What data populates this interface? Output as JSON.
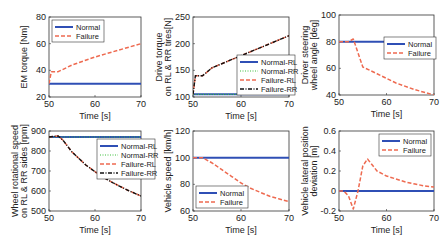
{
  "colors": {
    "normal": "#2f4fb5",
    "failure": "#ee6a50",
    "normal_rr": "#3fbf3f",
    "failure_rr": "#111111"
  },
  "chart_data": [
    {
      "type": "line",
      "ylabel": "EM torque [Nm]",
      "xlabel": "Time [s]",
      "xlim": [
        50,
        70
      ],
      "ylim": [
        20,
        80
      ],
      "xticks": [
        "50",
        "60",
        "70"
      ],
      "yticks": [
        "20",
        "40",
        "60",
        "80"
      ],
      "legend": [
        "Normal",
        "Failure"
      ],
      "legend_position": "upper left",
      "series": [
        {
          "name": "Normal",
          "x": [
            50,
            70
          ],
          "y": [
            30,
            30
          ]
        },
        {
          "name": "Failure",
          "x": [
            50,
            50.5,
            51,
            52,
            55,
            60,
            65,
            70
          ],
          "y": [
            30,
            39,
            39,
            39,
            44,
            50,
            55,
            60
          ]
        }
      ]
    },
    {
      "type": "line",
      "ylabel": "Drive torque on RL & RR tires[N]",
      "xlabel": "Time [s]",
      "xlim": [
        50,
        70
      ],
      "ylim": [
        100,
        250
      ],
      "xticks": [
        "50",
        "60",
        "70"
      ],
      "yticks": [
        "100",
        "150",
        "200",
        "250"
      ],
      "legend": [
        "Normal-RL",
        "Normal-RR",
        "Failure-RL",
        "Failure-RR"
      ],
      "legend_position": "lower right",
      "series": [
        {
          "name": "Normal-RL",
          "x": [
            50,
            70
          ],
          "y": [
            105,
            105
          ]
        },
        {
          "name": "Normal-RR",
          "x": [
            50,
            70
          ],
          "y": [
            105,
            105
          ]
        },
        {
          "name": "Failure-RL",
          "x": [
            50,
            50.5,
            51,
            52,
            54,
            58,
            62,
            66,
            70
          ],
          "y": [
            105,
            140,
            140,
            140,
            155,
            170,
            185,
            200,
            215
          ]
        },
        {
          "name": "Failure-RR",
          "x": [
            50,
            50.5,
            51,
            52,
            54,
            58,
            62,
            66,
            70
          ],
          "y": [
            105,
            140,
            140,
            140,
            155,
            170,
            185,
            200,
            215
          ]
        }
      ]
    },
    {
      "type": "line",
      "ylabel": "Driver steering wheel angle [deg]",
      "xlabel": "Time [s]",
      "xlim": [
        50,
        70
      ],
      "ylim": [
        40,
        100
      ],
      "xticks": [
        "50",
        "60",
        "70"
      ],
      "yticks": [
        "40",
        "60",
        "80",
        "100"
      ],
      "legend": [
        "Normal",
        "Failure"
      ],
      "legend_position": "upper right",
      "series": [
        {
          "name": "Normal",
          "x": [
            50,
            70
          ],
          "y": [
            80,
            80
          ]
        },
        {
          "name": "Failure",
          "x": [
            50,
            52,
            53,
            55,
            58,
            62,
            66,
            70
          ],
          "y": [
            80,
            80,
            82,
            61,
            56,
            49,
            44,
            40
          ]
        }
      ]
    },
    {
      "type": "line",
      "ylabel": "Wheel rotational speed on RL & RR sides [rpm]",
      "xlabel": "Time [s]",
      "xlim": [
        50,
        70
      ],
      "ylim": [
        500,
        900
      ],
      "xticks": [
        "50",
        "60",
        "70"
      ],
      "yticks": [
        "500",
        "600",
        "700",
        "800",
        "900"
      ],
      "legend": [
        "Normal-RL",
        "Normal-RR",
        "Failure-RL",
        "Failure-RR"
      ],
      "legend_position": "upper right",
      "series": [
        {
          "name": "Normal-RL",
          "x": [
            50,
            70
          ],
          "y": [
            870,
            870
          ]
        },
        {
          "name": "Normal-RR",
          "x": [
            50,
            70
          ],
          "y": [
            870,
            870
          ]
        },
        {
          "name": "Failure-RL",
          "x": [
            50,
            52,
            53,
            55,
            58,
            61,
            64,
            67,
            70
          ],
          "y": [
            870,
            875,
            855,
            795,
            730,
            680,
            640,
            605,
            575
          ]
        },
        {
          "name": "Failure-RR",
          "x": [
            50,
            52,
            53,
            55,
            58,
            61,
            64,
            67,
            70
          ],
          "y": [
            870,
            875,
            855,
            795,
            730,
            680,
            640,
            605,
            575
          ]
        }
      ]
    },
    {
      "type": "line",
      "ylabel": "Vehicle speed [km/h]",
      "xlabel": "Time [s]",
      "xlim": [
        50,
        70
      ],
      "ylim": [
        60,
        120
      ],
      "xticks": [
        "50",
        "60",
        "70"
      ],
      "yticks": [
        "60",
        "80",
        "100",
        "120"
      ],
      "legend": [
        "Normal",
        "Failure"
      ],
      "legend_position": "lower left",
      "series": [
        {
          "name": "Normal",
          "x": [
            50,
            70
          ],
          "y": [
            100,
            100
          ]
        },
        {
          "name": "Failure",
          "x": [
            50,
            52,
            54,
            56,
            58,
            60,
            62,
            64,
            66,
            68,
            70
          ],
          "y": [
            100,
            100,
            96,
            91,
            86,
            81,
            77,
            74,
            71,
            69,
            67
          ]
        }
      ]
    },
    {
      "type": "line",
      "ylabel": "Vehicle lateral position deviation [m]",
      "xlabel": "Time [s]",
      "xlim": [
        50,
        70
      ],
      "ylim": [
        -0.2,
        0.6
      ],
      "xticks": [
        "50",
        "60",
        "70"
      ],
      "yticks": [
        "-0.2",
        "0",
        "0.2",
        "0.4",
        "0.6"
      ],
      "legend": [
        "Normal",
        "Failure"
      ],
      "legend_position": "upper right",
      "series": [
        {
          "name": "Normal",
          "x": [
            50,
            70
          ],
          "y": [
            0,
            0
          ]
        },
        {
          "name": "Failure",
          "x": [
            50,
            51,
            52,
            53,
            54,
            55,
            56,
            57,
            58,
            60,
            62,
            64,
            66,
            68,
            70
          ],
          "y": [
            0,
            0,
            -0.05,
            -0.18,
            0,
            0.25,
            0.32,
            0.26,
            0.2,
            0.15,
            0.12,
            0.09,
            0.07,
            0.05,
            0.04
          ]
        }
      ]
    }
  ]
}
